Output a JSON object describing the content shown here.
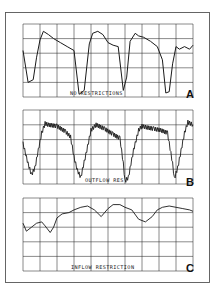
{
  "chart_data": [
    {
      "type": "line",
      "panel": "A",
      "title": "NO RESTRICTIONS",
      "panel_letter": "A",
      "xlabel": "",
      "ylabel": "",
      "grid": true,
      "grid_cols": 10,
      "grid_rows": 5,
      "x": [
        0,
        0.3,
        0.6,
        0.8,
        1.0,
        1.2,
        1.5,
        1.8,
        2.2,
        2.6,
        3.0,
        3.3,
        3.6,
        3.9,
        4.1,
        4.4,
        4.7,
        5.0,
        5.3,
        5.6,
        5.9,
        6.1,
        6.3,
        6.6,
        6.8,
        7.1,
        7.5,
        7.9,
        8.2,
        8.4,
        8.6,
        8.8,
        9.0,
        9.2,
        9.5,
        9.8,
        10.0
      ],
      "values": [
        3.5,
        1.1,
        1.3,
        3.0,
        4.3,
        4.95,
        4.7,
        4.4,
        4.1,
        3.8,
        3.5,
        0.2,
        0.5,
        4.0,
        4.8,
        4.95,
        4.7,
        4.1,
        3.9,
        3.8,
        0.5,
        1.5,
        4.2,
        4.8,
        4.6,
        4.5,
        4.2,
        3.8,
        2.8,
        0.3,
        0.4,
        2.5,
        3.8,
        3.6,
        3.8,
        3.6,
        3.9
      ],
      "ylim": [
        0,
        5.5
      ]
    },
    {
      "type": "line",
      "panel": "B",
      "title": "OUTFLOW RES",
      "panel_letter": "B",
      "xlabel": "",
      "ylabel": "",
      "grid": true,
      "grid_cols": 10,
      "grid_rows": 5,
      "x": [
        0,
        0.3,
        0.5,
        0.7,
        0.9,
        1.1,
        1.3,
        1.5,
        2.0,
        2.5,
        2.8,
        3.0,
        3.2,
        3.4,
        3.7,
        4.0,
        4.3,
        4.8,
        5.3,
        5.7,
        5.9,
        6.0,
        6.2,
        6.5,
        6.8,
        7.0,
        7.3,
        7.7,
        8.1,
        8.5,
        8.8,
        8.9,
        9.1,
        9.3,
        9.5,
        9.7,
        10.0
      ],
      "values": [
        3.0,
        1.5,
        0.7,
        1.2,
        2.5,
        3.8,
        4.5,
        4.4,
        4.3,
        3.9,
        3.5,
        2.0,
        1.0,
        0.5,
        2.2,
        4.0,
        4.4,
        4.1,
        3.7,
        3.4,
        1.5,
        0.2,
        0.5,
        2.5,
        4.0,
        4.3,
        4.2,
        4.1,
        4.0,
        3.8,
        1.5,
        0.4,
        1.2,
        2.5,
        3.8,
        4.6,
        4.4
      ],
      "noise_amplitude": 0.25,
      "ylim": [
        0,
        5.5
      ]
    },
    {
      "type": "line",
      "panel": "C",
      "title": "INFLOW RESTRICTION",
      "panel_letter": "C",
      "xlabel": "",
      "ylabel": "",
      "grid": true,
      "grid_cols": 10,
      "grid_rows": 5,
      "x": [
        0,
        0.2,
        0.5,
        0.8,
        1.1,
        1.3,
        1.6,
        1.8,
        2.0,
        2.3,
        2.7,
        3.0,
        3.4,
        3.8,
        4.2,
        4.6,
        5.0,
        5.3,
        5.7,
        6.0,
        6.4,
        6.8,
        7.2,
        7.6,
        7.9,
        8.2,
        8.6,
        9.0,
        9.4,
        9.8,
        10.0
      ],
      "values": [
        3.6,
        3.0,
        3.3,
        3.6,
        3.7,
        3.4,
        2.9,
        3.3,
        4.0,
        4.3,
        4.4,
        4.6,
        4.8,
        4.9,
        4.6,
        4.1,
        4.7,
        5.0,
        5.0,
        4.8,
        4.6,
        3.9,
        3.7,
        4.1,
        4.6,
        4.8,
        4.9,
        4.8,
        4.7,
        4.6,
        4.5
      ],
      "ylim": [
        0,
        5.5
      ]
    }
  ],
  "panels": [
    {
      "label": "NO RESTRICTIONS",
      "letter": "A"
    },
    {
      "label": "OUTFLOW RES",
      "letter": "B"
    },
    {
      "label": "INFLOW RESTRICTION",
      "letter": "C"
    }
  ],
  "colors": {
    "trace": "#1a1a1a",
    "grid": "#2a2a2a",
    "frame": "#444444",
    "background": "#ffffff"
  }
}
